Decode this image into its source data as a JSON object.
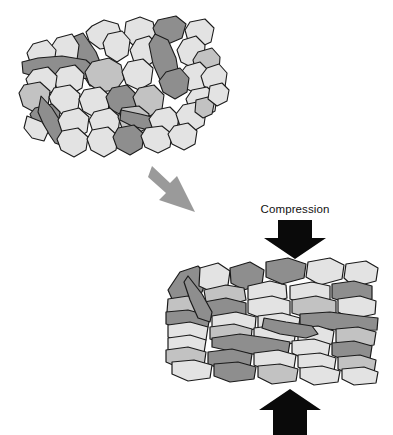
{
  "figure": {
    "background_color": "#ffffff",
    "width": 393,
    "height": 435
  },
  "labels": {
    "compression": "Compression"
  },
  "palette": {
    "clast_light": "#e3e3e3",
    "clast_mid": "#c2c2c2",
    "clast_dark": "#8e8e8e",
    "outline": "#1b1b1b",
    "arrow_black": "#0a0a0a",
    "arrow_gray": "#9a9a9a",
    "background": "#ffffff"
  },
  "panels": [
    {
      "id": "uncompacted-mass",
      "name": "Uncompacted sediment aggregate",
      "x": 18,
      "y": 12,
      "width": 200,
      "height": 140,
      "description": "Loosely packed rounded and elongate clasts with open pore space"
    },
    {
      "id": "compacted-mass",
      "name": "Compacted sediment aggregate",
      "x": 165,
      "y": 258,
      "width": 215,
      "height": 125,
      "description": "Tightly packed angular clasts with flattened grain contacts"
    }
  ],
  "arrows": [
    {
      "id": "process-arrow",
      "name": "process-flow-arrow",
      "color": "#9a9a9a",
      "direction": "down-right",
      "from": [
        152,
        166
      ],
      "to": [
        194,
        214
      ]
    },
    {
      "id": "compression-arrow-top",
      "name": "compression-arrow-top",
      "color": "#0a0a0a",
      "direction": "down",
      "label": "Compression",
      "from": [
        295,
        220
      ],
      "to": [
        295,
        258
      ]
    },
    {
      "id": "compression-arrow-bottom",
      "name": "compression-arrow-bottom",
      "color": "#0a0a0a",
      "direction": "up",
      "label": "",
      "from": [
        290,
        430
      ],
      "to": [
        290,
        389
      ]
    }
  ],
  "clasts_uncompacted": [
    {
      "t": "l",
      "p": "92,26 104,20 118,24 122,36 115,47 100,49 89,41 86,32"
    },
    {
      "t": "l",
      "p": "126,22 140,17 153,22 156,34 149,44 133,45 124,37"
    },
    {
      "t": "d",
      "p": "158,20 176,16 186,24 182,38 168,44 157,38 153,28"
    },
    {
      "t": "l",
      "p": "190,22 205,19 214,28 211,42 198,48 188,41 185,30"
    },
    {
      "t": "d",
      "p": "83,33 96,52 104,72 101,84 90,86 80,70 72,50 73,37"
    },
    {
      "t": "l",
      "p": "57,38 72,34 79,45 77,60 65,66 54,59 51,47"
    },
    {
      "t": "l",
      "p": "33,44 47,40 56,50 54,64 43,71 31,65 27,53"
    },
    {
      "t": "d",
      "p": "22,62 38,58 62,56 86,60 95,68 90,78 66,80 40,78 23,73"
    },
    {
      "t": "l",
      "p": "108,34 122,31 130,40 128,55 117,62 106,55 103,43"
    },
    {
      "t": "l",
      "p": "136,40 149,36 158,45 157,59 146,67 134,62 130,50"
    },
    {
      "t": "d",
      "p": "155,34 168,40 176,58 179,76 172,86 161,82 153,64 149,44"
    },
    {
      "t": "l",
      "p": "183,40 196,36 205,45 204,60 193,68 181,62 177,50"
    },
    {
      "t": "m",
      "p": "198,52 212,48 220,57 219,71 208,78 196,72 193,60"
    },
    {
      "t": "l",
      "p": "60,68 75,65 84,74 82,88 70,95 57,89 53,77"
    },
    {
      "t": "l",
      "p": "33,70 48,67 57,76 55,90 43,97 30,91 26,79"
    },
    {
      "t": "m",
      "p": "92,62 109,58 121,65 124,79 116,90 100,92 89,84 85,72"
    },
    {
      "t": "l",
      "p": "128,62 143,59 153,68 151,83 139,90 126,84 122,72"
    },
    {
      "t": "l",
      "p": "186,66 200,62 209,71 207,86 195,93 183,87 179,75"
    },
    {
      "t": "l",
      "p": "207,68 219,64 227,73 225,87 214,93 204,86 201,76"
    },
    {
      "t": "d",
      "p": "166,72 180,68 189,78 187,92 175,99 163,92 159,81"
    },
    {
      "t": "m",
      "p": "24,85 40,82 50,91 48,106 36,113 23,106 19,93"
    },
    {
      "t": "l",
      "p": "54,88 70,85 80,94 78,109 66,116 53,109 49,97"
    },
    {
      "t": "l",
      "p": "84,90 100,87 110,96 108,111 96,118 83,111 79,99"
    },
    {
      "t": "d",
      "p": "112,88 127,85 137,95 135,109 123,116 110,109 106,97"
    },
    {
      "t": "m",
      "p": "139,88 154,85 164,95 162,109 150,116 137,109 133,97"
    },
    {
      "t": "l",
      "p": "192,90 207,87 217,96 215,111 203,118 190,111 186,99"
    },
    {
      "t": "d",
      "p": "35,108 52,104 60,112 58,124 46,131 34,124 30,114"
    },
    {
      "t": "d",
      "p": "41,96 52,108 62,124 70,138 66,147 55,143 45,128 38,112"
    },
    {
      "t": "l",
      "p": "63,112 79,108 89,117 87,132 75,139 62,132 58,120"
    },
    {
      "t": "l",
      "p": "94,112 110,108 120,117 118,132 106,139 93,132 89,120"
    },
    {
      "t": "m",
      "p": "122,108 139,106 149,114 147,128 135,135 122,128 118,117"
    },
    {
      "t": "d",
      "p": "121,110 140,114 164,120 184,124 190,131 180,136 157,132 132,126 120,120"
    },
    {
      "t": "l",
      "p": "156,110 170,107 179,116 177,130 165,136 153,130 149,119"
    },
    {
      "t": "l",
      "p": "183,105 197,102 206,111 204,125 192,132 180,126 176,114"
    },
    {
      "t": "l",
      "p": "62,131 78,128 88,137 86,150 74,157 61,150 57,139"
    },
    {
      "t": "l",
      "p": "92,130 108,127 118,136 116,150 104,157 91,150 87,139"
    },
    {
      "t": "d",
      "p": "118,128 134,125 144,134 142,148 130,155 117,148 113,137"
    },
    {
      "t": "l",
      "p": "146,128 162,126 172,134 170,147 158,153 145,147 141,136"
    },
    {
      "t": "l",
      "p": "174,126 188,123 197,131 195,144 184,150 172,144 168,134"
    },
    {
      "t": "l",
      "p": "27,116 42,122 48,132 44,141 32,138 24,128"
    },
    {
      "t": "m",
      "p": "196,100 208,97 214,104 212,114 203,118 195,112"
    },
    {
      "t": "l",
      "p": "210,86 222,83 229,90 227,101 217,106 208,99"
    }
  ],
  "clasts_compacted": [
    {
      "t": "d",
      "p": "168,290 180,272 198,266 208,276 202,292 186,300 172,299"
    },
    {
      "t": "l",
      "p": "200,268 218,263 230,271 228,285 212,292 199,286"
    },
    {
      "t": "d",
      "p": "230,268 250,262 264,270 262,284 244,290 231,283"
    },
    {
      "t": "m",
      "p": "204,290 226,285 244,288 246,300 226,306 206,302"
    },
    {
      "t": "l",
      "p": "248,286 270,281 286,285 287,298 266,304 248,299"
    },
    {
      "t": "d",
      "p": "266,262 288,258 306,264 304,278 282,284 266,277"
    },
    {
      "t": "l",
      "p": "308,262 330,258 344,265 342,279 320,285 306,277"
    },
    {
      "t": "l",
      "p": "346,264 366,261 378,268 376,281 354,287 344,278"
    },
    {
      "t": "l",
      "p": "290,286 312,282 330,286 330,300 308,305 290,299"
    },
    {
      "t": "d",
      "p": "332,284 354,281 372,286 372,299 350,304 332,298"
    },
    {
      "t": "m",
      "p": "168,299 188,296 202,301 200,314 180,318 167,312"
    },
    {
      "t": "d",
      "p": "204,302 226,298 246,303 246,316 224,321 205,315"
    },
    {
      "t": "l",
      "p": "248,300 272,296 290,301 290,315 266,320 248,313"
    },
    {
      "t": "m",
      "p": "292,300 316,296 336,301 336,314 312,319 292,313"
    },
    {
      "t": "l",
      "p": "338,299 360,296 376,301 375,314 352,319 338,312"
    },
    {
      "t": "d",
      "p": "166,312 188,310 210,316 208,327 186,330 166,324"
    },
    {
      "t": "l",
      "p": "212,316 236,312 256,317 255,329 230,333 212,328"
    },
    {
      "t": "l",
      "p": "258,316 282,313 300,318 298,330 274,334 258,328"
    },
    {
      "t": "d",
      "p": "300,314 330,312 360,316 378,318 377,330 348,331 316,328 300,325"
    },
    {
      "t": "l",
      "p": "168,325 190,322 208,327 206,340 184,344 168,337"
    },
    {
      "t": "m",
      "p": "210,327 234,324 252,329 251,341 228,345 210,339"
    },
    {
      "t": "l",
      "p": "254,328 278,325 296,330 294,343 270,347 254,340"
    },
    {
      "t": "l",
      "p": "298,328 318,326 334,331 332,344 310,348 298,341"
    },
    {
      "t": "m",
      "p": "336,329 358,327 376,332 374,345 352,348 336,342"
    },
    {
      "t": "d",
      "p": "212,338 240,334 268,338 290,342 288,354 260,355 230,351 212,347"
    },
    {
      "t": "l",
      "p": "168,338 190,335 206,340 204,353 182,357 168,350"
    },
    {
      "t": "l",
      "p": "292,341 314,339 330,344 328,357 306,360 292,353"
    },
    {
      "t": "d",
      "p": "332,343 354,341 372,346 370,359 348,362 332,355"
    },
    {
      "t": "m",
      "p": "166,350 188,347 206,352 204,366 182,369 166,362"
    },
    {
      "t": "d",
      "p": "208,352 232,349 252,354 250,367 226,371 208,364"
    },
    {
      "t": "l",
      "p": "254,353 278,350 296,355 294,368 270,372 254,365"
    },
    {
      "t": "l",
      "p": "298,355 320,353 336,358 334,371 312,374 298,367"
    },
    {
      "t": "m",
      "p": "338,357 360,355 376,360 374,373 352,376 338,369"
    },
    {
      "t": "l",
      "p": "172,362 194,360 212,365 210,378 188,381 172,374"
    },
    {
      "t": "d",
      "p": "214,364 238,362 256,367 254,379 230,382 214,376"
    },
    {
      "t": "m",
      "p": "258,366 280,364 298,369 296,381 272,384 258,377"
    },
    {
      "t": "l",
      "p": "300,368 322,366 340,371 338,382 314,385 300,378"
    },
    {
      "t": "l",
      "p": "342,369 364,367 378,372 376,383 354,385 342,379"
    },
    {
      "t": "d",
      "p": "188,276 202,294 212,312 210,322 198,318 190,300 184,282"
    },
    {
      "t": "d",
      "p": "264,318 286,322 312,326 318,334 306,338 280,334 262,328"
    }
  ]
}
